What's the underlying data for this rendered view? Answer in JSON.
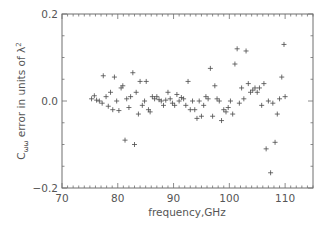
{
  "chart_data": {
    "type": "scatter",
    "title": "",
    "xlabel": "frequency,GHz",
    "ylabel": "C_ωω error in units of λ²",
    "ylabel_parts": {
      "main": "C",
      "sub": "ωω",
      "rest": " error in units of λ",
      "sup": "2"
    },
    "xlim": [
      70,
      115
    ],
    "ylim": [
      -0.2,
      0.2
    ],
    "x_ticks": [
      70,
      80,
      90,
      100,
      110
    ],
    "x_tick_labels": [
      "70",
      "80",
      "90",
      "100",
      "110"
    ],
    "y_ticks": [
      -0.2,
      0.0,
      0.2
    ],
    "y_tick_labels": [
      "−0.2",
      "0.0",
      "0.2"
    ],
    "grid": false,
    "legend": null,
    "marker": "+",
    "series": [
      {
        "name": "Cww error",
        "points": [
          [
            75.3,
            0.005
          ],
          [
            75.8,
            0.012
          ],
          [
            76.2,
            0.002
          ],
          [
            76.7,
            0.0
          ],
          [
            77.2,
            -0.005
          ],
          [
            77.4,
            0.058
          ],
          [
            77.9,
            0.01
          ],
          [
            78.3,
            -0.012
          ],
          [
            78.7,
            0.02
          ],
          [
            79.1,
            -0.02
          ],
          [
            79.4,
            0.055
          ],
          [
            79.8,
            0.0
          ],
          [
            80.2,
            -0.022
          ],
          [
            80.6,
            0.03
          ],
          [
            80.9,
            0.035
          ],
          [
            81.3,
            -0.09
          ],
          [
            81.6,
            0.005
          ],
          [
            82.0,
            -0.015
          ],
          [
            82.3,
            0.01
          ],
          [
            82.7,
            0.065
          ],
          [
            83.0,
            -0.1
          ],
          [
            83.3,
            0.02
          ],
          [
            83.7,
            -0.03
          ],
          [
            84.0,
            0.045
          ],
          [
            84.4,
            -0.01
          ],
          [
            84.8,
            0.0
          ],
          [
            85.1,
            0.045
          ],
          [
            85.5,
            -0.02
          ],
          [
            85.8,
            -0.025
          ],
          [
            86.2,
            0.01
          ],
          [
            86.6,
            0.005
          ],
          [
            87.0,
            0.01
          ],
          [
            87.4,
            0.003
          ],
          [
            87.8,
            0.0
          ],
          [
            88.2,
            -0.01
          ],
          [
            88.6,
            0.002
          ],
          [
            89.0,
            0.02
          ],
          [
            89.4,
            0.005
          ],
          [
            89.8,
            -0.005
          ],
          [
            90.2,
            -0.01
          ],
          [
            90.6,
            0.015
          ],
          [
            91.0,
            0.0
          ],
          [
            91.4,
            0.008
          ],
          [
            91.8,
            0.005
          ],
          [
            92.2,
            -0.01
          ],
          [
            92.6,
            0.045
          ],
          [
            93.0,
            -0.02
          ],
          [
            93.4,
            0.0
          ],
          [
            93.8,
            -0.02
          ],
          [
            94.2,
            -0.04
          ],
          [
            94.6,
            0.0
          ],
          [
            95.0,
            -0.035
          ],
          [
            95.4,
            -0.01
          ],
          [
            95.8,
            0.01
          ],
          [
            96.2,
            0.005
          ],
          [
            96.6,
            0.075
          ],
          [
            97.0,
            -0.035
          ],
          [
            97.4,
            0.035
          ],
          [
            97.8,
            0.005
          ],
          [
            98.2,
            0.0
          ],
          [
            98.6,
            -0.045
          ],
          [
            99.0,
            -0.02
          ],
          [
            99.4,
            -0.025
          ],
          [
            99.8,
            -0.015
          ],
          [
            100.2,
            0.0
          ],
          [
            100.6,
            -0.03
          ],
          [
            101.0,
            0.085
          ],
          [
            101.4,
            0.12
          ],
          [
            101.8,
            -0.005
          ],
          [
            102.2,
            0.03
          ],
          [
            102.6,
            0.005
          ],
          [
            103.0,
            0.115
          ],
          [
            103.4,
            0.04
          ],
          [
            103.8,
            0.02
          ],
          [
            104.2,
            0.025
          ],
          [
            104.6,
            0.03
          ],
          [
            105.0,
            0.02
          ],
          [
            105.4,
            0.03
          ],
          [
            105.8,
            -0.01
          ],
          [
            106.2,
            0.04
          ],
          [
            106.6,
            -0.11
          ],
          [
            107.0,
            0.0
          ],
          [
            107.4,
            -0.165
          ],
          [
            107.8,
            -0.005
          ],
          [
            108.2,
            -0.095
          ],
          [
            108.6,
            -0.03
          ],
          [
            109.0,
            0.005
          ],
          [
            109.4,
            0.055
          ],
          [
            109.8,
            0.13
          ],
          [
            110.0,
            0.01
          ]
        ]
      }
    ]
  },
  "plot_area": {
    "left": 62,
    "top": 14,
    "right": 313,
    "bottom": 188
  },
  "colors": {
    "axis": "#6e6e6e",
    "marker": "#4a4a4a",
    "text": "#555555",
    "background": "#ffffff"
  }
}
